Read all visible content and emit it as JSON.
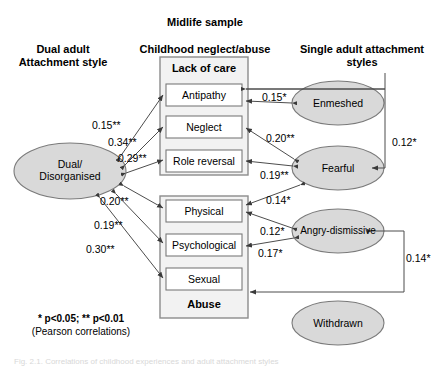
{
  "headers": {
    "midlife": "Midlife sample",
    "left_line1": "Dual adult",
    "left_line2": "Attachment style",
    "center": "Childhood neglect/abuse",
    "right_line1": "Single adult attachment",
    "right_line2": "styles"
  },
  "groups": {
    "lack_of_care": "Lack of care",
    "abuse": "Abuse"
  },
  "boxes": [
    {
      "id": "antipathy",
      "label": "Antipathy"
    },
    {
      "id": "neglect",
      "label": "Neglect"
    },
    {
      "id": "role_reversal",
      "label": "Role reversal"
    },
    {
      "id": "physical",
      "label": "Physical"
    },
    {
      "id": "psychological",
      "label": "Psychological"
    },
    {
      "id": "sexual",
      "label": "Sexual"
    }
  ],
  "ellipses": [
    {
      "id": "dual",
      "line1": "Dual/",
      "line2": "Disorganised"
    },
    {
      "id": "enmeshed",
      "line1": "Enmeshed",
      "line2": ""
    },
    {
      "id": "fearful",
      "line1": "Fearful",
      "line2": ""
    },
    {
      "id": "angry_dismissive",
      "line1": "Angry-dismissive",
      "line2": ""
    },
    {
      "id": "withdrawn",
      "line1": "Withdrawn",
      "line2": ""
    }
  ],
  "coefficients": {
    "dual_antipathy": "0.15**",
    "dual_neglect": "0.34**",
    "dual_role_reversal": "0.29**",
    "dual_physical": "0.20**",
    "dual_psychological": "0.19**",
    "dual_sexual": "0.30**",
    "enmeshed_antipathy": "0.15*",
    "fearful_neglect": "0.20**",
    "fearful_role_reversal": "0.19**",
    "fearful_physical": "0.14*",
    "angry_physical": "0.12*",
    "angry_psychological": "0.17*",
    "enmeshed_fearful": "0.12*",
    "angry_withdrawn": "0.14*"
  },
  "legend": {
    "line1": "* p<0.05; ** p<0.01",
    "line2": "(Pearson correlations)"
  },
  "caption": "Fig. 2.1. Correlations of childhood experiences and adult attachment styles",
  "colors": {
    "ellipse_fill": "#d9d9d9",
    "ellipse_stroke": "#808080",
    "box_stroke": "#808080",
    "group_fill": "#f2f2f2",
    "line": "#4d4d4d",
    "text": "#000000"
  }
}
